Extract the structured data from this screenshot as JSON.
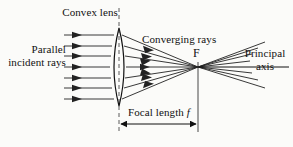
{
  "figure": {
    "background_color": "#fbfbf9",
    "ink_color": "#111111",
    "width": 293,
    "height": 147
  },
  "labels": {
    "incident_rays": "Parallel incident rays",
    "lens": "Convex lens",
    "converging_rays": "Converging rays",
    "focal_point": "F",
    "principal_axis": "Principal axis",
    "focal_length": "Focal length",
    "focal_length_symbol": "f"
  },
  "diagram_data": {
    "type": "ray-diagram",
    "optical_element": "biconvex-lens",
    "incident_ray_count": 7,
    "converging_ray_count": 7,
    "diverging_ray_count": 7,
    "lens": {
      "center_x": 119,
      "center_y": 67,
      "top_y": 28,
      "bottom_y": 106,
      "half_thickness": 9
    },
    "focal_point": {
      "x": 198,
      "y": 67,
      "symbol": "F"
    },
    "principal_axis": {
      "y": 67,
      "x_start": 64,
      "x_end": 289
    },
    "focal_length_measure": {
      "from_x": 119,
      "to_x": 198,
      "dimension_y": 124
    },
    "incident_rays_y": [
      35,
      46,
      56,
      67,
      78,
      88,
      99
    ],
    "ray_start_x": 64,
    "arrowhead_x_incident": 78
  }
}
